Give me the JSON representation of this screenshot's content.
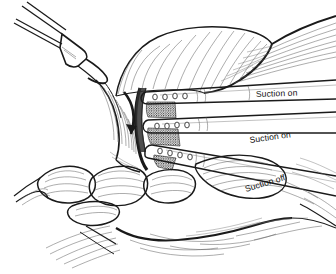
{
  "figure": {
    "medium": "pen-and-ink line drawing",
    "background_color": "#ffffff",
    "ink_color": "#1a1a1a",
    "hatch_color": "#5a5a5a",
    "width": 336,
    "height": 274
  },
  "labels": [
    {
      "id": "label-suction-on-top",
      "text": "Suction on",
      "x": 256,
      "y": 97,
      "rotation": -2.0
    },
    {
      "id": "label-suction-on-middle",
      "text": "Suction on",
      "x": 250,
      "y": 143,
      "rotation": -8.0
    },
    {
      "id": "label-suction-off",
      "text": "Suction off",
      "x": 246,
      "y": 192,
      "rotation": -17.0
    }
  ],
  "catheters": [
    {
      "id": "catheter-top",
      "state": "Suction on",
      "hole_count": 4,
      "angle_deg": -2.0
    },
    {
      "id": "catheter-middle",
      "state": "Suction on",
      "hole_count": 4,
      "angle_deg": -8.0
    },
    {
      "id": "catheter-bottom",
      "state": "Suction off",
      "hole_count": 4,
      "angle_deg": -17.0
    }
  ],
  "instruments": [
    {
      "id": "forceps",
      "name": "forceps-clamp",
      "location": "upper-left",
      "description": "two-pronged grasping forceps retracting tissue"
    }
  ],
  "annotations": [
    {
      "id": "retraction-arrow",
      "name": "curved-down-arrow",
      "direction": "down",
      "description": "curved arrow indicating downward tissue retraction"
    }
  ],
  "anatomy": [
    {
      "id": "upper-tissue-mass",
      "name": "striated-tissue-upper",
      "description": "large striated tissue mass occupying upper portion"
    },
    {
      "id": "lower-lobules",
      "name": "lobular-structures",
      "description": "rounded lobular structures at lower left"
    },
    {
      "id": "tissue-incision",
      "name": "dark-incision-edge",
      "description": "dark vertical cut edge where catheters enter"
    },
    {
      "id": "stippled-lumen",
      "name": "stippled-lumen-region",
      "description": "dark stippled granular areas between catheter tips"
    },
    {
      "id": "floor-tissue",
      "name": "floor-tissue",
      "description": "broad tissue plane across lower portion"
    }
  ]
}
